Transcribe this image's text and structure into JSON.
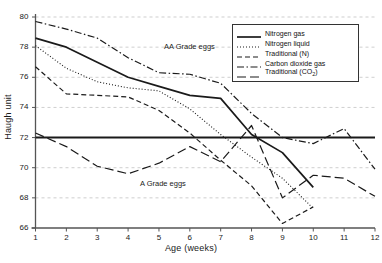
{
  "chart_data": {
    "type": "line",
    "title": "",
    "xlabel": "Age (weeks)",
    "ylabel": "Haugh unit",
    "xlim": [
      1,
      12
    ],
    "ylim": [
      66,
      80
    ],
    "xticks": [
      "1",
      "2",
      "3",
      "4",
      "5",
      "6",
      "7",
      "8",
      "9",
      "10",
      "11",
      "12"
    ],
    "yticks": [
      "66",
      "68",
      "70",
      "72",
      "74",
      "76",
      "78",
      "80"
    ],
    "grid": "horizontal-dashed",
    "legend_position": "top-right",
    "reference_line": {
      "value": 72,
      "label": "grade-threshold"
    },
    "annotations": [
      {
        "text": "AA Grade eggs",
        "x": 5.9,
        "y": 78.4
      },
      {
        "text": "A Grade eggs",
        "x": 5.2,
        "y": 69.6
      }
    ],
    "x": [
      1,
      2,
      3,
      4,
      5,
      6,
      7,
      8,
      9,
      10,
      11,
      12
    ],
    "series": [
      {
        "name": "Nitrogen gas",
        "style": "solid",
        "x": [
          1,
          2,
          3,
          4,
          5,
          6,
          7,
          8,
          9,
          10
        ],
        "values": [
          78.6,
          78.0,
          77.0,
          76.0,
          75.4,
          74.8,
          74.6,
          72.2,
          71.0,
          68.7
        ]
      },
      {
        "name": "Nitrogen liquid",
        "style": "dotted",
        "x": [
          1,
          2,
          3,
          4,
          5,
          6,
          7,
          8,
          9,
          10
        ],
        "values": [
          78.1,
          76.6,
          75.7,
          75.3,
          75.1,
          73.9,
          72.2,
          70.7,
          69.3,
          67.3
        ]
      },
      {
        "name": "Traditional (N)",
        "style": "dashed",
        "x": [
          1,
          2,
          3,
          4,
          5,
          6,
          7,
          8,
          9,
          10
        ],
        "values": [
          76.7,
          74.9,
          74.8,
          74.7,
          73.8,
          72.3,
          70.5,
          68.8,
          66.3,
          67.4
        ]
      },
      {
        "name": "Carbon dioxide gas",
        "style": "dash-dot",
        "x": [
          1,
          2,
          3,
          4,
          5,
          6,
          7,
          8,
          9,
          10,
          11,
          12
        ],
        "values": [
          79.7,
          79.2,
          78.6,
          77.3,
          76.3,
          76.2,
          75.6,
          73.6,
          72.0,
          71.6,
          72.6,
          69.9
        ]
      },
      {
        "name": "Traditional (CO2)",
        "style": "long-dash",
        "x": [
          1,
          2,
          3,
          4,
          5,
          6,
          7,
          8,
          9,
          10,
          11,
          12
        ],
        "values": [
          72.3,
          71.4,
          70.1,
          69.6,
          70.3,
          71.4,
          70.4,
          72.8,
          68.0,
          69.5,
          69.3,
          68.1
        ]
      }
    ]
  },
  "legend": {
    "items": [
      {
        "label": "Nitrogen gas"
      },
      {
        "label": "Nitrogen liquid"
      },
      {
        "label": "Traditional (N)"
      },
      {
        "label": "Carbon dioxide gas"
      },
      {
        "label": "Traditional (CO",
        "sub": "2",
        "tail": ")"
      }
    ]
  }
}
